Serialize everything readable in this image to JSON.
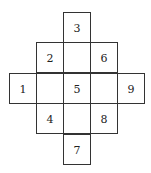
{
  "diagram": {
    "line_color": "#333333",
    "cells": [
      {
        "row": 0,
        "col": 2,
        "label": "3"
      },
      {
        "row": 1,
        "col": 1,
        "label": "2"
      },
      {
        "row": 1,
        "col": 2,
        "label": ""
      },
      {
        "row": 1,
        "col": 3,
        "label": "6"
      },
      {
        "row": 2,
        "col": 0,
        "label": "1"
      },
      {
        "row": 2,
        "col": 1,
        "label": ""
      },
      {
        "row": 2,
        "col": 2,
        "label": "5"
      },
      {
        "row": 2,
        "col": 3,
        "label": ""
      },
      {
        "row": 2,
        "col": 4,
        "label": "9"
      },
      {
        "row": 3,
        "col": 1,
        "label": "4"
      },
      {
        "row": 3,
        "col": 2,
        "label": ""
      },
      {
        "row": 3,
        "col": 3,
        "label": "8"
      },
      {
        "row": 4,
        "col": 2,
        "label": "7"
      }
    ]
  }
}
